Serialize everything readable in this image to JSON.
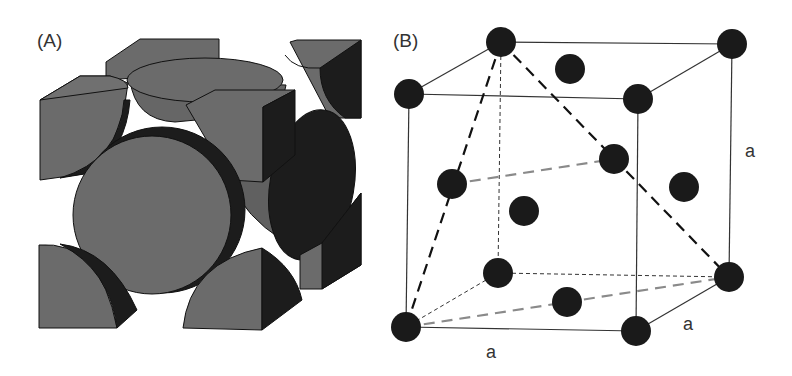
{
  "figure": {
    "panel_a": {
      "label": "(A)",
      "description": "Face-centered cubic unit cell, space-filling (hard-sphere) model showing corner sphere octants and face-centered half spheres"
    },
    "panel_b": {
      "label": "(B)",
      "description": "Face-centered cubic unit cell, ball-and-stick lattice model with edge length a; dashed lines indicate a tetrahedron of close-packed atoms",
      "edge_label_vertical": "a",
      "edge_label_depth": "a",
      "edge_label_horizontal": "a"
    },
    "colors": {
      "sphere_face": "#6b6b6b",
      "sphere_shadow": "#1e1e1e",
      "atom": "#1a1a1a",
      "line": "#333333",
      "gray_dash": "#8a8a8a"
    }
  }
}
